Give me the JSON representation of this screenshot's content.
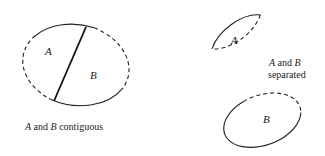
{
  "diagram": {
    "contiguous": {
      "region_a_label": "A",
      "region_b_label": "B",
      "caption": {
        "a": "A",
        "and": " and ",
        "b": "B",
        "rest": " contiguous"
      }
    },
    "separated": {
      "region_a_label": "A",
      "region_b_label": "B",
      "caption_line1": {
        "a": "A",
        "and": " and ",
        "b": "B"
      },
      "caption_line2": "separated"
    }
  }
}
